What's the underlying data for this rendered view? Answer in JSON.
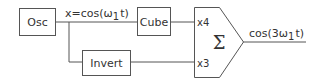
{
  "diagram": {
    "blocks": {
      "oscillator": {
        "label": "Osc"
      },
      "cube": {
        "label": "Cube"
      },
      "invert": {
        "label": "Invert"
      }
    },
    "signals": {
      "input": {
        "text": "x=cos(ω",
        "sub": "1",
        "tail": "t)"
      },
      "output": {
        "text": "cos(3ω",
        "sub": "1",
        "tail": "t)"
      }
    },
    "summer": {
      "symbol": "Σ",
      "gain_top": "x4",
      "gain_bottom": "x3"
    }
  }
}
